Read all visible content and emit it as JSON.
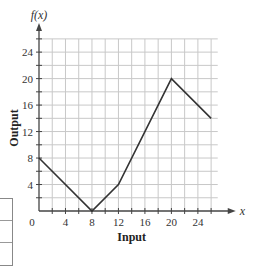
{
  "chart_data": {
    "type": "line",
    "title": "",
    "xlabel": "Input",
    "ylabel": "Output",
    "x_axis_var": "x",
    "y_axis_var": "f(x)",
    "xlim": [
      0,
      27
    ],
    "ylim": [
      0,
      26
    ],
    "x_ticks": [
      0,
      4,
      8,
      12,
      16,
      20,
      24
    ],
    "x_tick_labels": [
      "0",
      "4",
      "8",
      "12",
      "16",
      "20",
      "24"
    ],
    "y_ticks": [
      4,
      8,
      12,
      16,
      20,
      24
    ],
    "y_tick_labels": [
      "4",
      "8",
      "12",
      "16",
      "20",
      "24"
    ],
    "grid": true,
    "grid_step": 2,
    "series": [
      {
        "name": "f(x)",
        "points": [
          [
            0,
            8
          ],
          [
            8,
            0
          ],
          [
            12,
            4
          ],
          [
            20,
            20
          ],
          [
            26,
            14
          ]
        ]
      }
    ],
    "colors": {
      "line": "#333333",
      "grid": "#c8c8c8",
      "axis": "#444444"
    }
  }
}
